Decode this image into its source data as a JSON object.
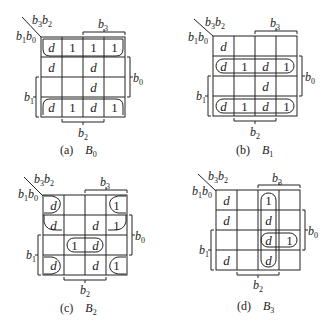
{
  "figure": "Karnaugh maps for outputs B0, B1, B2, B3",
  "axis_labels": {
    "corner_top": "b3b2",
    "corner_left": "b1b0",
    "brace_b3": "b3",
    "brace_b2": "b2",
    "brace_b0": "b0",
    "brace_b1": "b1"
  },
  "maps": [
    {
      "id": "a",
      "caption_letter": "(a)",
      "caption_var": "B",
      "caption_sub": "0",
      "cells": [
        [
          "d",
          "1",
          "1",
          "1"
        ],
        [
          "d",
          "",
          "d",
          ""
        ],
        [
          "",
          "",
          "d",
          ""
        ],
        [
          "d",
          "1",
          "d",
          "1"
        ]
      ]
    },
    {
      "id": "b",
      "caption_letter": "(b)",
      "caption_var": "B",
      "caption_sub": "1",
      "cells": [
        [
          "d",
          "",
          "",
          ""
        ],
        [
          "d",
          "1",
          "d",
          "1"
        ],
        [
          "",
          "",
          "d",
          ""
        ],
        [
          "d",
          "1",
          "d",
          "1"
        ]
      ]
    },
    {
      "id": "c",
      "caption_letter": "(c)",
      "caption_var": "B",
      "caption_sub": "2",
      "cells": [
        [
          "d",
          "",
          "",
          "1"
        ],
        [
          "d",
          "",
          "d",
          "1"
        ],
        [
          "",
          "1",
          "d",
          ""
        ],
        [
          "d",
          "",
          "d",
          "1"
        ]
      ]
    },
    {
      "id": "d",
      "caption_letter": "(d)",
      "caption_var": "B",
      "caption_sub": "3",
      "cells": [
        [
          "d",
          "",
          "1",
          ""
        ],
        [
          "d",
          "",
          "d",
          ""
        ],
        [
          "",
          "",
          "d",
          "1"
        ],
        [
          "d",
          "",
          "d",
          ""
        ]
      ]
    }
  ]
}
